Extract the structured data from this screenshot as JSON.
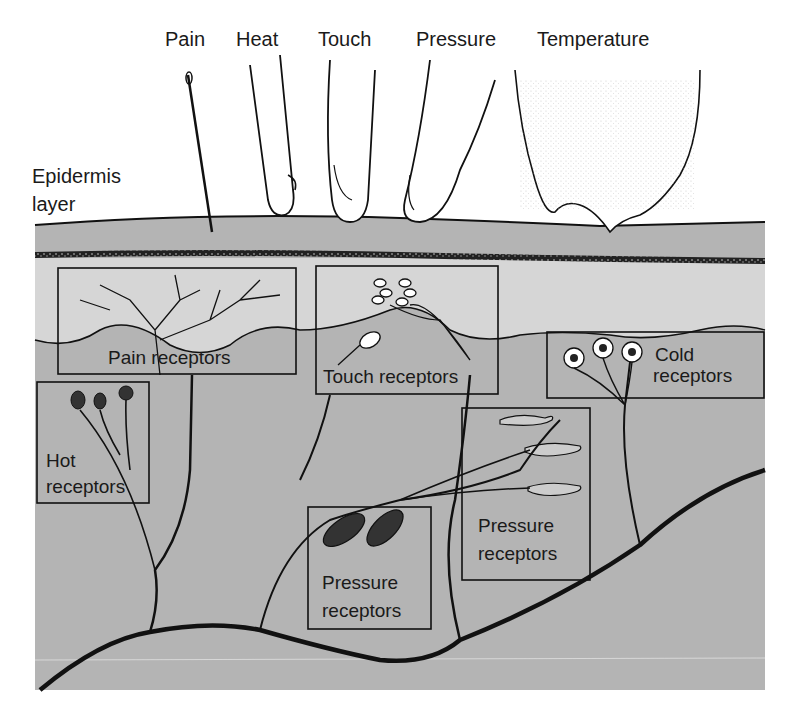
{
  "diagram": {
    "colors": {
      "background": "#ffffff",
      "dermis": "#b4b4b4",
      "upper_dermis_light": "#d4d4d4",
      "epidermis": "#bdbdbd",
      "line": "#111111",
      "text": "#1a1a1a"
    },
    "stimuli": [
      {
        "label": "Pain",
        "icon": "needle-icon"
      },
      {
        "label": "Heat",
        "icon": "hot-probe-icon"
      },
      {
        "label": "Touch",
        "icon": "finger-icon"
      },
      {
        "label": "Pressure",
        "icon": "finger-press-icon"
      },
      {
        "label": "Temperature",
        "icon": "ice-cube-icon"
      }
    ],
    "layer_label": {
      "line1": "Epidermis",
      "line2": "layer"
    },
    "receptor_boxes": [
      {
        "id": "pain",
        "lines": [
          "Pain receptors"
        ]
      },
      {
        "id": "touch",
        "lines": [
          "Touch receptors"
        ]
      },
      {
        "id": "cold",
        "lines": [
          "Cold",
          "receptors"
        ]
      },
      {
        "id": "hot",
        "lines": [
          "Hot",
          "receptors"
        ]
      },
      {
        "id": "pressure-deep",
        "lines": [
          "Pressure",
          "receptors"
        ]
      },
      {
        "id": "pressure-mid",
        "lines": [
          "Pressure",
          "receptors"
        ]
      }
    ]
  }
}
